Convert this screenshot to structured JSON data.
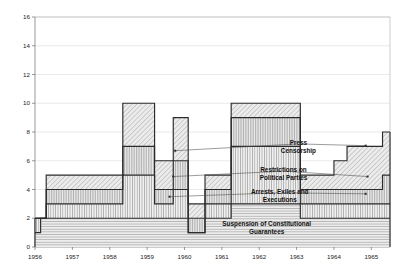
{
  "chart_data": {
    "type": "area",
    "subtype": "stacked-step-area",
    "title": "",
    "subtitle": "",
    "xlabel": "",
    "ylabel": "",
    "xlim": [
      1956,
      1965.5
    ],
    "ylim": [
      0,
      16
    ],
    "y_ticks": [
      0,
      2,
      4,
      6,
      8,
      10,
      12,
      14,
      16
    ],
    "x_ticks": [
      1956,
      1957,
      1958,
      1959,
      1960,
      1961,
      1962,
      1963,
      1964,
      1965
    ],
    "x_tick_labels": [
      "1956",
      "1957",
      "1958",
      "1959",
      "1960",
      "1961",
      "1962",
      "1963",
      "1964",
      "1965"
    ],
    "grid": "horizontal",
    "legend_position": "inline-annotations",
    "stack_order": "bottom-to-top",
    "series": [
      {
        "name": "Suspension of Constitutional Guarantees",
        "fill": "#d9d9d9",
        "hatch": "horizontal-lines",
        "x": [
          1956.0,
          1956.15,
          1956.3,
          1958.35,
          1959.2,
          1960.1,
          1960.55,
          1961.25,
          1963.1,
          1964.0,
          1965.3
        ],
        "values": [
          1,
          2,
          2,
          2,
          2,
          1,
          2,
          3,
          2,
          2,
          2
        ]
      },
      {
        "name": "Arrests, Exiles and Executions",
        "fill": "#e3e3e3",
        "hatch": "vertical-lines",
        "x": [
          1956.0,
          1956.15,
          1956.3,
          1958.35,
          1959.2,
          1959.7,
          1960.1,
          1960.55,
          1961.25,
          1963.1,
          1964.0,
          1965.3
        ],
        "values": [
          1,
          0,
          1,
          3,
          1,
          2,
          0,
          1,
          4,
          1,
          1,
          1
        ]
      },
      {
        "name": "Restrictions on Political Parties",
        "fill": "#dedede",
        "hatch": "vertical-dense",
        "x": [
          1956.0,
          1956.3,
          1958.35,
          1959.2,
          1959.7,
          1960.1,
          1960.55,
          1961.25,
          1963.1,
          1964.0,
          1965.3
        ],
        "values": [
          0,
          1,
          2,
          1,
          2,
          1,
          1,
          2,
          1,
          1,
          2
        ]
      },
      {
        "name": "Press Censorship",
        "fill": "#dcdcdc",
        "hatch": "diagonal-lines",
        "x": [
          1956.0,
          1956.3,
          1958.35,
          1959.2,
          1959.7,
          1960.1,
          1960.55,
          1961.25,
          1962.0,
          1963.1,
          1964.0,
          1964.35,
          1965.3
        ],
        "values": [
          0,
          1,
          3,
          2,
          3,
          1,
          1,
          1,
          1,
          1,
          2,
          3,
          3
        ]
      }
    ],
    "stacked_totals": {
      "note": "top-of-stack plateau heights read off the y-axis",
      "segments": [
        {
          "from": 1956.0,
          "to": 1956.15,
          "total": 2
        },
        {
          "from": 1956.15,
          "to": 1956.3,
          "total": 2
        },
        {
          "from": 1956.3,
          "to": 1958.35,
          "total": 4
        },
        {
          "from": 1958.35,
          "to": 1959.2,
          "total": 10
        },
        {
          "from": 1959.2,
          "to": 1959.7,
          "total": 6
        },
        {
          "from": 1959.7,
          "to": 1960.1,
          "total": 8
        },
        {
          "from": 1960.1,
          "to": 1960.55,
          "total": 1
        },
        {
          "from": 1960.55,
          "to": 1961.25,
          "total": 4
        },
        {
          "from": 1961.25,
          "to": 1962.0,
          "total": 10
        },
        {
          "from": 1962.0,
          "to": 1963.1,
          "total": 8
        },
        {
          "from": 1963.1,
          "to": 1964.0,
          "total": 4
        },
        {
          "from": 1964.0,
          "to": 1964.35,
          "total": 6
        },
        {
          "from": 1964.35,
          "to": 1965.3,
          "total": 8
        }
      ]
    },
    "annotations": [
      {
        "id": "press-censorship",
        "text_line1": "Press",
        "text_line2": "Censorship",
        "text_x": 1963.05,
        "text_y": 7.0,
        "target_points": [
          {
            "x": 1959.75,
            "y": 6.7
          },
          {
            "x": 1964.85,
            "y": 7.05
          }
        ]
      },
      {
        "id": "restrictions-on-political-parties",
        "text_line1": "Restrictions on",
        "text_line2": "Political Parties",
        "text_x": 1962.65,
        "text_y": 5.1,
        "target_points": [
          {
            "x": 1959.7,
            "y": 4.9
          },
          {
            "x": 1964.9,
            "y": 4.9
          }
        ]
      },
      {
        "id": "arrests-exiles-and-executions",
        "text_line1": "Arrests, Exiles and",
        "text_line2": "Executions",
        "text_x": 1962.55,
        "text_y": 3.6,
        "target_points": [
          {
            "x": 1959.6,
            "y": 3.5
          },
          {
            "x": 1964.85,
            "y": 3.7
          }
        ]
      },
      {
        "id": "suspension-of-constitutional-guarantees",
        "text_line1": "Suspension of Constitutional",
        "text_line2": "Guarantees",
        "text_x": 1962.2,
        "text_y": 1.35,
        "target_points": []
      }
    ]
  },
  "axes": {
    "y_tick_labels": [
      "0",
      "2",
      "4",
      "6",
      "8",
      "10",
      "12",
      "14",
      "16"
    ],
    "x_tick_labels": [
      "1956",
      "1957",
      "1958",
      "1959",
      "1960",
      "1961",
      "1962",
      "1963",
      "1964",
      "1965"
    ]
  },
  "colors": {
    "background": "#ffffff",
    "axis": "#6f6f6f",
    "frame": "#b9b9b9",
    "grid": "#dcdcdc",
    "outline": "#2b2b2b",
    "text": "#111111"
  }
}
